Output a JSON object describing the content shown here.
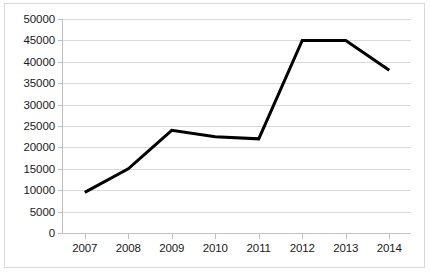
{
  "chart_data": {
    "type": "line",
    "title": "",
    "xlabel": "",
    "ylabel": "",
    "categories": [
      "2007",
      "2008",
      "2009",
      "2010",
      "2011",
      "2012",
      "2013",
      "2014"
    ],
    "values": [
      9500,
      15000,
      24000,
      22500,
      22000,
      45000,
      45000,
      38000
    ],
    "series": [
      {
        "name": "",
        "values": [
          9500,
          15000,
          24000,
          22500,
          22000,
          45000,
          45000,
          38000
        ],
        "color": "#000000",
        "line_width": 3
      }
    ],
    "ylim": [
      0,
      50000
    ],
    "ytick_step": 5000,
    "yticks": [
      0,
      5000,
      10000,
      15000,
      20000,
      25000,
      30000,
      35000,
      40000,
      45000,
      50000
    ],
    "ytick_labels": [
      "0",
      "5000",
      "10000",
      "15000",
      "20000",
      "25000",
      "30000",
      "35000",
      "40000",
      "45000",
      "50000"
    ],
    "xticks": [
      "2007",
      "2008",
      "2009",
      "2010",
      "2011",
      "2012",
      "2013",
      "2014"
    ],
    "grid": true,
    "grid_axis": "y",
    "legend": false,
    "legend_position": "none",
    "colors": {
      "line": "#000000",
      "gridline": "#d9d9d9",
      "axis": "#bfbfbf",
      "border": "#d8d8d8",
      "background": "#ffffff",
      "text": "#1a1a1a"
    }
  }
}
